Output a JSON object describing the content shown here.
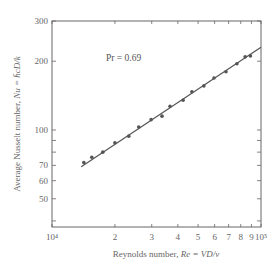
{
  "chart_data": {
    "type": "scatter",
    "title": "",
    "xlabel": "Reynolds number, Re = VD/ν",
    "ylabel": "Average Nusselt number, Nu = h̄cD/k",
    "xscale": "log",
    "yscale": "log",
    "xlim": [
      10000,
      100000
    ],
    "ylim": [
      35,
      300
    ],
    "grid": false,
    "legend": null,
    "x_ticks": [
      {
        "value": 10000,
        "label": "10⁴"
      },
      {
        "value": 20000,
        "label": "2"
      },
      {
        "value": 30000,
        "label": "3"
      },
      {
        "value": 40000,
        "label": "4"
      },
      {
        "value": 50000,
        "label": "5"
      },
      {
        "value": 60000,
        "label": "6"
      },
      {
        "value": 70000,
        "label": "7"
      },
      {
        "value": 80000,
        "label": "8"
      },
      {
        "value": 90000,
        "label": "9"
      },
      {
        "value": 100000,
        "label": "10⁵"
      }
    ],
    "y_ticks": [
      {
        "value": 300,
        "label": "300"
      },
      {
        "value": 200,
        "label": "200"
      },
      {
        "value": 100,
        "label": "100"
      },
      {
        "value": 90,
        "label": ""
      },
      {
        "value": 80,
        "label": ""
      },
      {
        "value": 70,
        "label": "70"
      },
      {
        "value": 60,
        "label": "60"
      },
      {
        "value": 50,
        "label": "50"
      },
      {
        "value": 40,
        "label": ""
      }
    ],
    "annotations": [
      {
        "text": "Pr = 0.69",
        "x": 17000,
        "y": 200
      }
    ],
    "series": [
      {
        "name": "measured",
        "type": "scatter",
        "x": [
          14200,
          15500,
          17500,
          20000,
          23300,
          26000,
          29800,
          33600,
          36700,
          42400,
          46700,
          53300,
          59600,
          68000,
          76700,
          84000,
          89000
        ],
        "y": [
          72,
          76,
          80,
          88,
          94,
          103,
          111,
          115,
          127,
          135,
          147,
          156,
          169,
          180,
          195,
          209,
          211
        ]
      },
      {
        "name": "correlation fit",
        "type": "line",
        "x": [
          13800,
          100000
        ],
        "y": [
          69,
          230
        ]
      }
    ]
  },
  "labels": {
    "annotation": "Pr = 0.69",
    "xlabel_prefix": "Reynolds number, ",
    "xlabel_formula": "Re = VD/ν",
    "ylabel_prefix": "Average Nusselt number, ",
    "ylabel_formula": "Nu = h̄cD/k"
  }
}
